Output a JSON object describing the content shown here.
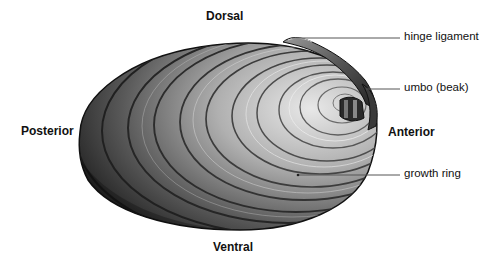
{
  "figure": {
    "orientation_labels": {
      "dorsal": "Dorsal",
      "ventral": "Ventral",
      "anterior": "Anterior",
      "posterior": "Posterior"
    },
    "callouts": [
      {
        "id": "hinge-ligament",
        "label": "hinge ligament"
      },
      {
        "id": "umbo",
        "label": "umbo (beak)"
      },
      {
        "id": "growth-ring",
        "label": "growth ring"
      }
    ],
    "colors": {
      "background": "#ffffff",
      "shell_dark": "#1e1e1e",
      "shell_mid": "#6a6a6a",
      "shell_light": "#d8d8d8",
      "leader_line": "#555555",
      "text": "#111111"
    }
  }
}
